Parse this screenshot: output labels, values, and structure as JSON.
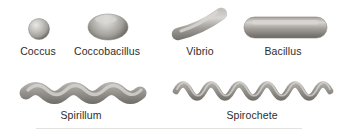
{
  "shapes": [
    {
      "name": "coccus",
      "label": "Coccus"
    },
    {
      "name": "coccobacillus",
      "label": "Coccobacillus"
    },
    {
      "name": "vibrio",
      "label": "Vibrio"
    },
    {
      "name": "bacillus",
      "label": "Bacillus"
    },
    {
      "name": "spirillum",
      "label": "Spirillum"
    },
    {
      "name": "spirochete",
      "label": "Spirochete"
    }
  ],
  "colors": {
    "background": "#ffffff",
    "highlight_bright": "#eae9e6",
    "body_highlight": "#d8d6d2",
    "body_light": "#c3c1bd",
    "body_mid": "#a3a09b",
    "body_dark": "#827f7a",
    "body_shadow": "#6b6864",
    "rim": "#85827e",
    "label_text": "#2d2d2d",
    "baseline_rule": "#e4e2de"
  }
}
